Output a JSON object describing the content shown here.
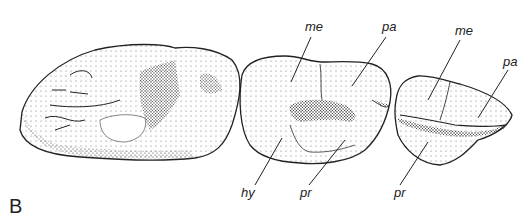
{
  "figure": {
    "panel_letter": "B",
    "teeth": [
      {
        "id": "tooth-1",
        "labels": []
      },
      {
        "id": "tooth-2",
        "labels": [
          "me",
          "pa",
          "hy",
          "pr"
        ]
      },
      {
        "id": "tooth-3",
        "labels": [
          "me",
          "pa",
          "pr"
        ]
      }
    ],
    "labels": {
      "t2_me": "me",
      "t2_pa": "pa",
      "t2_hy": "hy",
      "t2_pr": "pr",
      "t3_me": "me",
      "t3_pa": "pa",
      "t3_pr": "pr"
    },
    "colors": {
      "ink": "#222222",
      "background": "#ffffff"
    }
  }
}
